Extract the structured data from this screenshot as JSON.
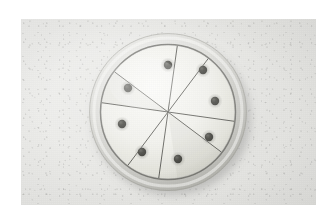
{
  "page": {
    "background_color": "#ffffff",
    "width": 336,
    "height": 223
  },
  "photo": {
    "alt": "Overhead photograph of a round shallow dish whose pale contents are scored into eight equal wedges, with one dark round seed placed near the outer edge of each wedge",
    "frame": {
      "x": 21,
      "y": 19,
      "width": 295,
      "height": 186
    },
    "surface": {
      "name": "speckled-tabletop",
      "color": "#e9e9e6",
      "highlight_color": "#f1f1ef",
      "shadow_color": "#e1e1de"
    },
    "subject": {
      "name": "round-sliced-dish",
      "center": {
        "x": 168,
        "y": 112
      },
      "rim": {
        "outer_radius": 79,
        "inner_radius": 67,
        "color": "#d2d2ce",
        "highlight_color": "#f4f4f2",
        "shadow_color": "#a9a9a4",
        "edge_line_color": "#6f6f6b"
      },
      "contents": {
        "name": "pale-wedge-disc",
        "radius": 66,
        "color": "#f3f3ee",
        "shade_color": "#dcdcd5",
        "cut_line_color": "#5a5a56",
        "cut_line_width": 1.0,
        "wedge_count": 8,
        "cut_count": 4,
        "cut_angles_deg": [
          8,
          53,
          98,
          143
        ]
      },
      "drop_shadow": {
        "color": "rgba(120,120,116,0.33)",
        "offset_x": 4,
        "offset_y": 6,
        "blur": 9
      }
    },
    "markers": {
      "name": "dark-seed-dots",
      "count": 8,
      "fill_color": "#54544f",
      "core_color": "#3d3d39",
      "halo_color": "rgba(120,120,114,0.30)",
      "radius": 4.1,
      "orbit_radius": 48,
      "items": [
        {
          "label": "dot-1",
          "wedge": 1,
          "angle_deg": 256,
          "x": 168,
          "y": 65
        },
        {
          "label": "dot-2",
          "wedge": 2,
          "angle_deg": 301,
          "x": 203,
          "y": 70
        },
        {
          "label": "dot-3",
          "wedge": 3,
          "angle_deg": 346,
          "x": 215,
          "y": 101
        },
        {
          "label": "dot-4",
          "wedge": 4,
          "angle_deg": 31,
          "x": 209,
          "y": 137
        },
        {
          "label": "dot-5",
          "wedge": 5,
          "angle_deg": 76,
          "x": 178,
          "y": 159
        },
        {
          "label": "dot-6",
          "wedge": 6,
          "angle_deg": 121,
          "x": 142,
          "y": 152
        },
        {
          "label": "dot-7",
          "wedge": 7,
          "angle_deg": 166,
          "x": 122,
          "y": 124
        },
        {
          "label": "dot-8",
          "wedge": 8,
          "angle_deg": 211,
          "x": 128,
          "y": 88
        }
      ]
    }
  }
}
